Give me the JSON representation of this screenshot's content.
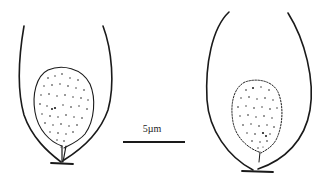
{
  "figure": {
    "type": "scientific-line-drawing",
    "specimens": [
      {
        "id": "left-specimen",
        "description": "cell with stippled inner body"
      },
      {
        "id": "right-specimen",
        "description": "cell with dotted-outline stippled inner body"
      }
    ],
    "scale_bar": {
      "label": "5µm",
      "length_px": 62
    },
    "colors": {
      "ink": "#1a1a1a",
      "background": "#ffffff"
    }
  }
}
